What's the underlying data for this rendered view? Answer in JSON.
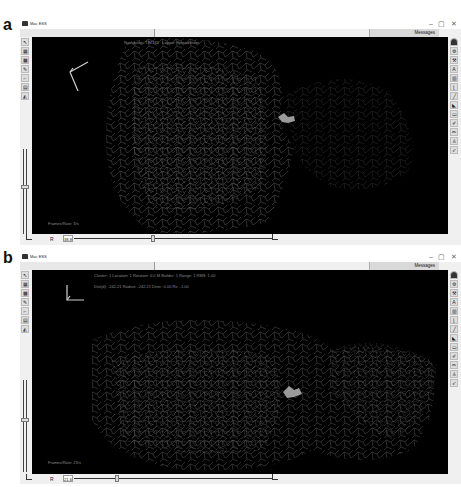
{
  "panels": [
    {
      "label": "a",
      "window": {
        "title": "Mac ESS",
        "controls": {
          "minimize": "–",
          "maximize": "▢",
          "close": "✕"
        },
        "menu": [
          "File",
          "Controls",
          "Graphics",
          "Macros",
          "Help"
        ],
        "messages_button": "Messages",
        "overlay_top": "Navigation: TIM133 · Layout: Spreadsheet",
        "overlay_bottom": "Frames/Rate: 3/s",
        "bottom_label": "R",
        "bottom_value": "38.8",
        "left_tools": [
          "arrow-icon",
          "arrow-alt-icon",
          "grid-icon",
          "checker-icon",
          "pencil-icon",
          "chart-icon",
          "table-icon",
          "shape-icon"
        ],
        "right_tools": [
          "user-icon",
          "gear-icon",
          "tool-icon",
          "letter-icon",
          "chart-bars-icon",
          "bracket-icon",
          "line-icon",
          "play-icon",
          "frame-icon",
          "pen-icon",
          "pen-alt-icon",
          "person-icon",
          "cursor-icon"
        ]
      }
    },
    {
      "label": "b",
      "window": {
        "title": "Mac ESS",
        "controls": {
          "minimize": "–",
          "maximize": "▢",
          "close": "✕"
        },
        "menu": [
          "File",
          "Controls",
          "Graphics",
          "Macros",
          "Help"
        ],
        "messages_button": "Messages",
        "overlay_top": "Cluster: 1 Location: 1 Rotation: 0.0 M Builder: 1 Range: 1 RMS: 1.00",
        "overlay_top2": "Dist(d): -242.21 Radius: -242.21 Direc: 0.00 Rs: -1.00",
        "overlay_bottom": "Frames/Rate: 23/s",
        "bottom_label": "R",
        "bottom_value": "21.6",
        "left_tools": [
          "arrow-icon",
          "arrow-alt-icon",
          "grid-icon",
          "checker-icon",
          "pencil-icon",
          "chart-icon",
          "table-icon",
          "shape-icon"
        ],
        "right_tools": [
          "user-icon",
          "gear-icon",
          "tool-icon",
          "letter-icon",
          "chart-bars-icon",
          "bracket-icon",
          "line-icon",
          "play-icon",
          "frame-icon",
          "pen-icon",
          "pen-alt-icon",
          "person-icon",
          "cursor-icon"
        ]
      }
    }
  ]
}
